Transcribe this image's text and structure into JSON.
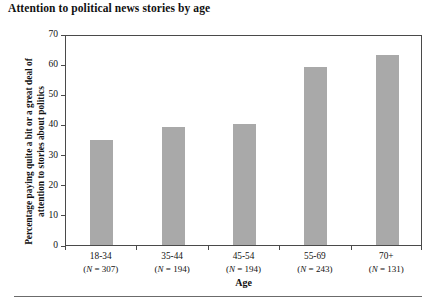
{
  "chart_data": {
    "type": "bar",
    "title": "Attention to political news stories by age",
    "xlabel": "Age",
    "ylabel": "Percentage paying quite a bit or a great deal of attention to stories about politics",
    "categories": [
      "18-34",
      "35-44",
      "45-54",
      "55-69",
      "70+"
    ],
    "category_sublabels": [
      "(N = 307)",
      "(N = 194)",
      "(N = 194)",
      "(N = 243)",
      "(N = 131)"
    ],
    "n_values": [
      307,
      194,
      194,
      243,
      131
    ],
    "values": [
      35,
      39,
      40,
      59,
      63
    ],
    "ylim": [
      0,
      70
    ],
    "ytick_values": [
      0,
      10,
      20,
      30,
      40,
      50,
      60,
      70
    ],
    "ytick_labels": [
      "0",
      "10",
      "20",
      "30",
      "40",
      "50",
      "60",
      "70"
    ],
    "grid": false,
    "legend": false,
    "bar_color": "#a9a9a9",
    "axis_color": "#4a4a4a",
    "text_color": "#111111"
  }
}
